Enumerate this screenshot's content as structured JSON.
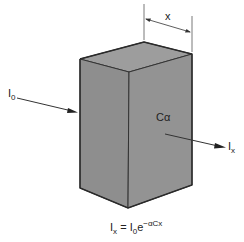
{
  "diagram": {
    "block": {
      "label": "Cα",
      "fill": "#8f8f8f",
      "top_fill": "#9a9a9a",
      "edge": "#333333"
    },
    "dimension": {
      "label": "x"
    },
    "incident": {
      "symbol": "I",
      "subscript": "0"
    },
    "transmitted": {
      "symbol": "I",
      "subscript": "x"
    },
    "equation": {
      "lhs_symbol": "I",
      "lhs_sub": "x",
      "equals": "=",
      "rhs_symbol": "I",
      "rhs_sub": "0",
      "base": "e",
      "exponent": "−αCx"
    }
  }
}
